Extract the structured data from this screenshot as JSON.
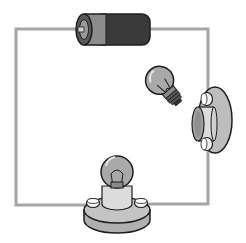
{
  "diagram": {
    "type": "electric-circuit",
    "components": [
      {
        "id": "battery",
        "kind": "battery",
        "label": "",
        "position": "top-center"
      },
      {
        "id": "bulb-loose",
        "kind": "light-bulb",
        "state": "unscrewed",
        "position": "upper-right-inside"
      },
      {
        "id": "socket-right",
        "kind": "bulb-socket",
        "state": "empty",
        "position": "right-edge"
      },
      {
        "id": "bulb-seated",
        "kind": "light-bulb-in-socket",
        "state": "seated",
        "position": "bottom-center"
      }
    ],
    "wire": {
      "color": "#a6a6a6",
      "path": "closed rectangular loop"
    },
    "colors": {
      "wire": "#a6a6a6",
      "battery_dark": "#3a3a3a",
      "battery_light": "#8c8c8c",
      "bulb_glass": "#a9a9a9",
      "socket_base": "#bdbdbd",
      "socket_collar": "#dcdcdc",
      "screw": "#f2f2f2",
      "outline": "#1e1e1e",
      "background": "#ffffff"
    }
  }
}
